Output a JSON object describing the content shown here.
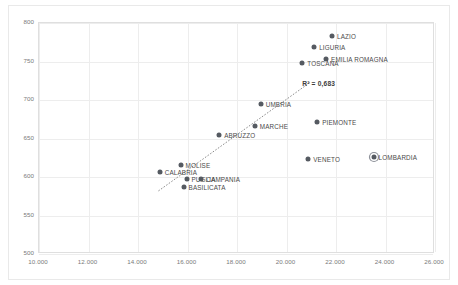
{
  "chart_data": {
    "type": "scatter",
    "title": "",
    "xlabel": "",
    "ylabel": "",
    "xlim": [
      10000,
      26000
    ],
    "ylim": [
      500,
      800
    ],
    "xticks": [
      "10.000",
      "12.000",
      "14.000",
      "16.000",
      "18.000",
      "20.000",
      "22.000",
      "24.000",
      "26.000"
    ],
    "xtick_values": [
      10000,
      12000,
      14000,
      16000,
      18000,
      20000,
      22000,
      24000,
      26000
    ],
    "yticks": [
      "500",
      "550",
      "600",
      "650",
      "700",
      "750",
      "800"
    ],
    "ytick_values": [
      500,
      550,
      600,
      650,
      700,
      750,
      800
    ],
    "grid": true,
    "legend": "none",
    "marker_color": "#555a61",
    "highlight_ring_color": "#8d9199",
    "gridline_color": "#ededed",
    "annotations": [
      {
        "name": "r-squared",
        "text": "R² = 0,683",
        "x": 21300,
        "y": 722
      }
    ],
    "trendline": {
      "type": "linear-dotted",
      "color": "#8a8a8a",
      "x_start": 14850,
      "y_start": 580,
      "x_end": 21000,
      "y_end": 722
    },
    "points": [
      {
        "label": "LAZIO",
        "x": 21840,
        "y": 783,
        "label_side": "right",
        "highlight": false
      },
      {
        "label": "LIGURIA",
        "x": 21120,
        "y": 769,
        "label_side": "right",
        "highlight": false
      },
      {
        "label": "EMILIA ROMAGNA",
        "x": 21600,
        "y": 753,
        "label_side": "right",
        "highlight": false
      },
      {
        "label": "TOSCANA",
        "x": 20640,
        "y": 748,
        "label_side": "right",
        "highlight": false
      },
      {
        "label": "UMBRIA",
        "x": 18960,
        "y": 695,
        "label_side": "right",
        "highlight": false
      },
      {
        "label": "PIEMONTE",
        "x": 21240,
        "y": 671,
        "label_side": "right",
        "highlight": false
      },
      {
        "label": "MARCHE",
        "x": 18720,
        "y": 666,
        "label_side": "right",
        "highlight": false
      },
      {
        "label": "ABRUZZO",
        "x": 17280,
        "y": 654,
        "label_side": "right",
        "highlight": false
      },
      {
        "label": "LOMBARDIA",
        "x": 23520,
        "y": 626,
        "label_side": "right",
        "highlight": true
      },
      {
        "label": "VENETO",
        "x": 20880,
        "y": 623,
        "label_side": "right",
        "highlight": false
      },
      {
        "label": "MOLISE",
        "x": 15720,
        "y": 616,
        "label_side": "right",
        "highlight": false
      },
      {
        "label": "CALABRIA",
        "x": 14880,
        "y": 607,
        "label_side": "right",
        "highlight": false
      },
      {
        "label": "PUGLIA",
        "x": 15960,
        "y": 597,
        "label_side": "right",
        "highlight": false
      },
      {
        "label": "CAMPANIA",
        "x": 16560,
        "y": 597,
        "label_side": "right",
        "highlight": false
      },
      {
        "label": "BASILICATA",
        "x": 15840,
        "y": 587,
        "label_side": "right",
        "highlight": false
      }
    ]
  }
}
